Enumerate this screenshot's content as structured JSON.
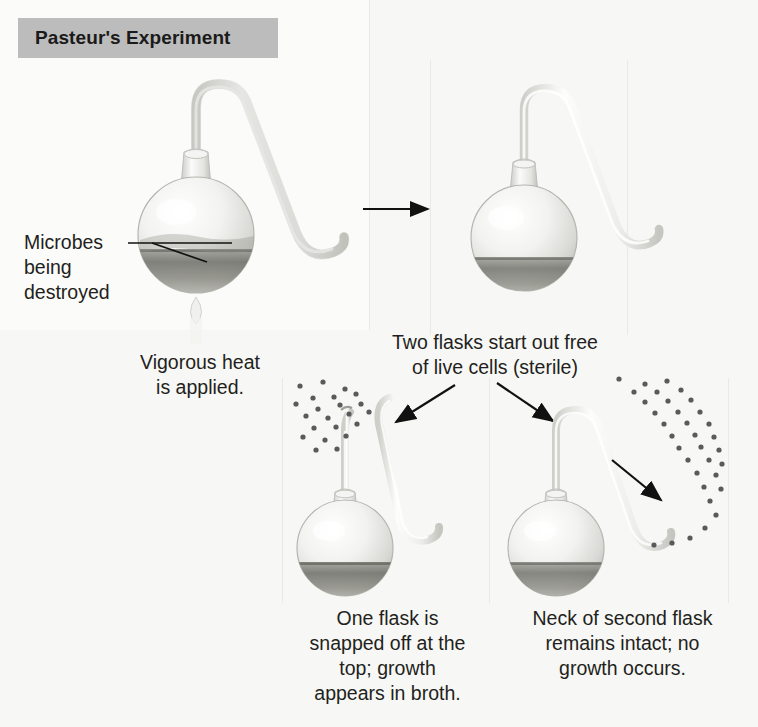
{
  "figure": {
    "title": "Pasteur's Experiment",
    "domain_type": "scientific-diagram",
    "background_color": "#f7f7f5",
    "banner_color": "#bcbcbc",
    "text_color": "#231f20"
  },
  "labels": {
    "microbes_line1": "Microbes",
    "microbes_line2": "being",
    "microbes_line3": "destroyed"
  },
  "captions": {
    "step1_line1": "Vigorous heat",
    "step1_line2": "is applied.",
    "step2_line1": "Two flasks start out free",
    "step2_line2": "of live cells (sterile)",
    "step3_line1": "One flask is",
    "step3_line2": "snapped off at the",
    "step3_line3": "top; growth",
    "step3_line4": "appears in broth.",
    "step4_line1": "Neck of second flask",
    "step4_line2": "remains intact; no",
    "step4_line3": "growth occurs."
  },
  "flasks": [
    {
      "id": "flask-heated",
      "name": "heated-swan-neck-flask",
      "neck": "intact-swan-neck",
      "broth": true,
      "heat_applied": true,
      "microbes_inside": "being-destroyed"
    },
    {
      "id": "flask-sterile",
      "name": "sterile-swan-neck-flask",
      "neck": "intact-swan-neck",
      "broth": true,
      "heat_applied": false,
      "microbes_inside": "none"
    },
    {
      "id": "flask-snapped",
      "name": "snapped-neck-flask",
      "neck": "snapped-off",
      "broth": true,
      "heat_applied": false,
      "microbes_inside": "growth-appears"
    },
    {
      "id": "flask-intact",
      "name": "intact-neck-flask",
      "neck": "intact-swan-neck",
      "broth": true,
      "heat_applied": false,
      "microbes_inside": "none-trapped-in-bend"
    }
  ],
  "arrows": [
    {
      "name": "arrow-heat-to-sterile",
      "direction": "right"
    },
    {
      "name": "arrow-to-snapped-flask",
      "direction": "down-left"
    },
    {
      "name": "arrow-to-intact-flask",
      "direction": "down-right"
    },
    {
      "name": "arrow-microbes-trapped",
      "direction": "down-right"
    }
  ],
  "microbe_dots": {
    "snapped_flask_cloud_count": 22,
    "intact_flask_cloud_count": 34,
    "dot_color": "#5a5a5a"
  }
}
